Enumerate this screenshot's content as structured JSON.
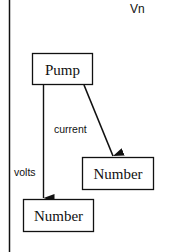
{
  "diagram": {
    "title": "Vn",
    "nodes": [
      {
        "id": "pump",
        "label": "Pump"
      },
      {
        "id": "number_volts",
        "label": "Number"
      },
      {
        "id": "number_current",
        "label": "Number"
      }
    ],
    "edges": [
      {
        "from": "pump",
        "to": "number_volts",
        "label": "volts"
      },
      {
        "from": "pump",
        "to": "number_current",
        "label": "current"
      }
    ]
  }
}
